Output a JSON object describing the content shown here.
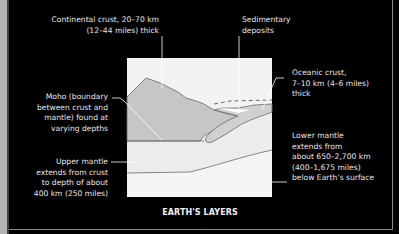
{
  "title": "EARTH'S LAYERS",
  "colors": {
    "background": "#000000",
    "diagram_bg": "#f2f2f2",
    "continental_crust": "#c4c4c4",
    "oceanic_crust": "#cfcfcf",
    "lines": "#6a6a6a",
    "text": "#e6e6e6",
    "strip": "#b5b5b5"
  },
  "labels": {
    "continental_crust": [
      "Continental crust, 20–70 km",
      "(12–44 miles) thick"
    ],
    "sedimentary": [
      "Sedimentary",
      "deposits"
    ],
    "oceanic_crust": [
      "Oceanic crust,",
      "7–10 km (4–6 miles)",
      "thick"
    ],
    "moho": [
      "Moho (boundary",
      "between crust and",
      "mantle) found at",
      "varying depths"
    ],
    "upper_mantle": [
      "Upper mantle",
      "extends from crust",
      "to depth of about",
      "400 km (250 miles)"
    ],
    "lower_mantle": [
      "Lower mantle",
      "extends from",
      "about  650–2,700 km",
      "(400–1,675 miles)",
      "below Earth’s surface"
    ]
  }
}
